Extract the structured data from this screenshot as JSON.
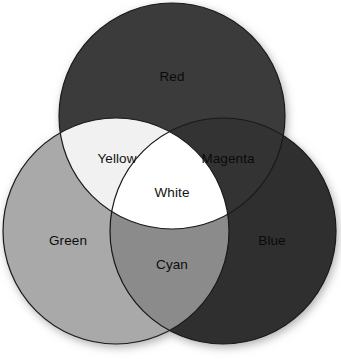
{
  "figure": {
    "background_color": "#ffffff",
    "width": 341,
    "height": 359
  },
  "chart_data": {
    "type": "venn",
    "set_count": 3,
    "legend_position": "none",
    "grid": false,
    "sets": [
      {
        "id": "red",
        "label": "Red",
        "fill_hex": "#3b3b3b",
        "label_color_hex": "#0a0a0a",
        "cx": 172,
        "cy": 116,
        "r": 113,
        "label_x": 172,
        "label_y": 77
      },
      {
        "id": "green",
        "label": "Green",
        "fill_hex": "#a9a9a9",
        "label_color_hex": "#0d0d0d",
        "cx": 116,
        "cy": 231,
        "r": 113,
        "label_x": 68,
        "label_y": 241
      },
      {
        "id": "blue",
        "label": "Blue",
        "fill_hex": "#2f2f2f",
        "label_color_hex": "#0a0a0a",
        "cx": 223,
        "cy": 231,
        "r": 113,
        "label_x": 272,
        "label_y": 241
      }
    ],
    "intersections": [
      {
        "id": "yellow",
        "label": "Yellow",
        "members": [
          "red",
          "green"
        ],
        "fill_hex": "#f1f1f1",
        "label_color_hex": "#111111",
        "label_x": 117,
        "label_y": 159
      },
      {
        "id": "magenta",
        "label": "Magenta",
        "members": [
          "red",
          "blue"
        ],
        "fill_hex": "#333333",
        "label_color_hex": "#0a0a0a",
        "label_x": 228,
        "label_y": 159
      },
      {
        "id": "cyan",
        "label": "Cyan",
        "members": [
          "green",
          "blue"
        ],
        "fill_hex": "#8b8b8b",
        "label_color_hex": "#0d0d0d",
        "label_x": 172,
        "label_y": 265
      },
      {
        "id": "white",
        "label": "White",
        "members": [
          "red",
          "green",
          "blue"
        ],
        "fill_hex": "#ffffff",
        "label_color_hex": "#111111",
        "label_x": 172,
        "label_y": 193
      }
    ]
  }
}
